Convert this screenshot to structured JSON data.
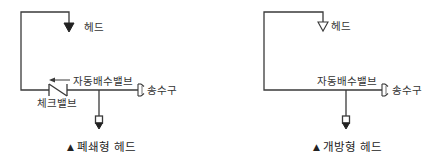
{
  "colors": {
    "line": "#3a3a3a",
    "text": "#333333",
    "background": "#ffffff"
  },
  "closed_diagram": {
    "caption_marker": "▲",
    "caption": "폐쇄형 헤드",
    "labels": {
      "head": "헤드",
      "auto_drain_valve": "자동배수밸브",
      "check_valve": "체크밸브",
      "fire_dept_connection": "송수구"
    },
    "head_symbol": "filled-triangle",
    "flow_arrow_direction": "left"
  },
  "open_diagram": {
    "caption_marker": "▲",
    "caption": "개방형 헤드",
    "labels": {
      "head": "헤드",
      "auto_drain_valve": "자동배수밸브",
      "fire_dept_connection": "송수구"
    },
    "head_symbol": "outlined-triangle"
  }
}
